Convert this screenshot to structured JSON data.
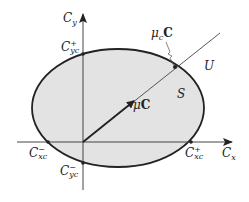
{
  "diagram": {
    "title": "",
    "colors": {
      "fill": "#e3e3e3",
      "stroke": "#222222",
      "axis": "#444444",
      "background": "#ffffff"
    },
    "axes": {
      "x": {
        "symbol": "C",
        "sub": "x"
      },
      "y": {
        "symbol": "C",
        "sub": "y"
      }
    },
    "intercepts": {
      "cxc_plus": {
        "symbol": "C",
        "sup": "+",
        "sub": "xc"
      },
      "cxc_minus": {
        "symbol": "C",
        "sup": "−",
        "sub": "xc"
      },
      "cyc_plus": {
        "symbol": "C",
        "sup": "+",
        "sub": "yc"
      },
      "cyc_minus": {
        "symbol": "C",
        "sup": "−",
        "sub": "yc"
      }
    },
    "regions": {
      "safe": "S",
      "unsafe": "U"
    },
    "vectors": {
      "mu_c": {
        "mu": "μ",
        "sub": "c",
        "vec": "C"
      },
      "mu": {
        "mu": "μ",
        "vec": "C"
      }
    },
    "geometry": {
      "origin": [
        83,
        142
      ],
      "ellipse": {
        "cx": 118,
        "cy": 108,
        "rx": 86,
        "ry": 59
      },
      "ray_end": [
        220,
        33
      ],
      "arrow_end": [
        135,
        100
      ]
    }
  }
}
